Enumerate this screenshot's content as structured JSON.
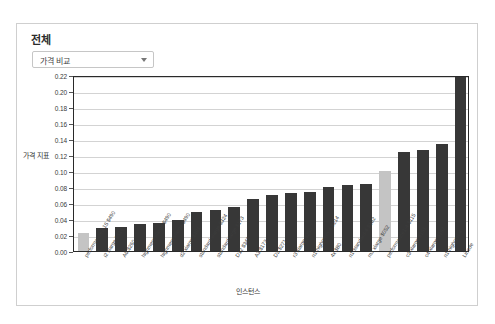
{
  "top_strip": {
    "ghost_text": "·· ····· · ··· · ···· ····· · · · ·· ·"
  },
  "card": {
    "title": "전체"
  },
  "metric_select": {
    "selected": "가격 비교",
    "caret": "chevron-down-icon"
  },
  "chart_data": {
    "type": "bar",
    "title": "전체",
    "xlabel": "인스턴스",
    "ylabel": "가격 지표",
    "ylim": [
      0,
      0.22
    ],
    "ytick_step": 0.02,
    "ytick_labels": [
      "0.00",
      "0.02",
      "0.04",
      "0.06",
      "0.08",
      "0.10",
      "0.12",
      "0.14",
      "0.16",
      "0.18",
      "0.20",
      "0.22"
    ],
    "grid": true,
    "legend": "none",
    "colors": {
      "bar": "#373737",
      "highlight": "#c4c4c4"
    },
    "categories": [
      "performance2 15 $490",
      "i2 xlarge $514",
      "A6 $260",
      "highmem xlarge $490",
      "highmem xlarge $490",
      "d2 xlarge $491",
      "standard xlarge $324",
      "standard large $173",
      "D12 $343",
      "A3 $173",
      "D3 $271",
      "r3 xlarge $250",
      "n1-highmem-4 $214",
      "4x $80",
      "n1-standard-4 $182",
      "m3 xlarge $052",
      "performance1-4 $115",
      "c3 xlarge $151",
      "c4 xlarge $167",
      "n1-highcpu-4",
      "Linode"
    ],
    "values": [
      0.022,
      0.029,
      0.03,
      0.034,
      0.035,
      0.039,
      0.049,
      0.051,
      0.055,
      0.065,
      0.07,
      0.073,
      0.074,
      0.08,
      0.083,
      0.084,
      0.1,
      0.124,
      0.126,
      0.134,
      0.222
    ],
    "highlighted_indices": [
      0,
      16
    ]
  }
}
